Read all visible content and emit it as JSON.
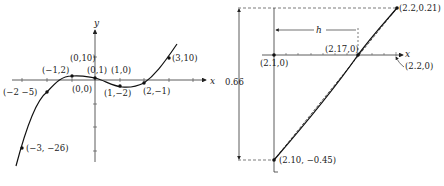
{
  "left_diagram": {
    "axis_labels": {
      "x": "x",
      "y": "y"
    },
    "points": [
      {
        "label": "(−3, −26)"
      },
      {
        "label": "(−2 −5)"
      },
      {
        "label": "(−1,2)"
      },
      {
        "label": "(0,1)"
      },
      {
        "label": "(1,−2)"
      },
      {
        "label": "(2,−1)"
      },
      {
        "label": "(3,10)"
      }
    ],
    "extra_labels": {
      "y_tick_10": "(0,10)",
      "origin": "(0,0)",
      "x_tick_1": "(1,0)"
    }
  },
  "right_diagram": {
    "axis_label_x": "x",
    "points": {
      "top": "(2.2,0.21)",
      "bottom": "(2.10, −0.45)",
      "root_approx": "(2.17,0)",
      "origin": "(2.1,0)",
      "x_end": "(2.2,0)"
    },
    "dimension_label": "0.66",
    "h_label": "h"
  },
  "colors": {
    "ink": "#222222",
    "background": "#ffffff"
  }
}
